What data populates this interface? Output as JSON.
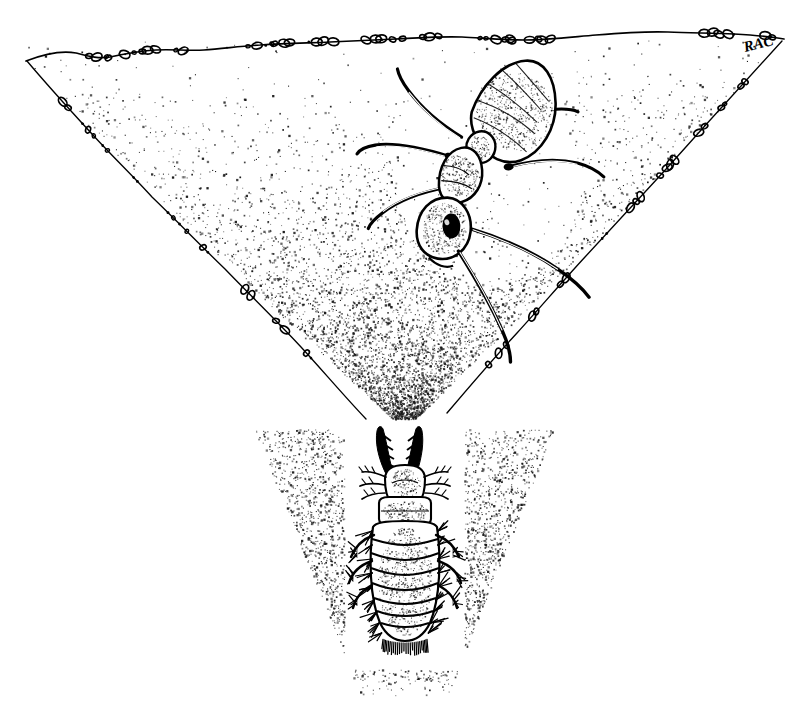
{
  "illustration": {
    "title": "Antlion pit trap with ant prey",
    "medium": "pen-and-ink stipple drawing",
    "background_color": "#ffffff",
    "ink_color": "#000000",
    "width": 811,
    "height": 715
  },
  "signature": {
    "text": "RAC",
    "x": 745,
    "y": 50
  },
  "ground": {
    "label": "ground surface line",
    "path": "M 26,61 C 50,52 66,50 78,54 C 90,58 100,60 112,57 C 126,53 140,50 160,50 C 182,50 200,52 222,49 C 250,45 272,44 300,42 C 330,40 360,41 392,39 C 424,37 452,36 478,37 C 500,38 520,40 544,40 C 570,40 596,36 622,34 C 650,32 676,31 700,32 C 724,33 748,33 768,35 C 776,36 780,37 784,39",
    "pebble_label": "surface sand grain"
  },
  "pit": {
    "label": "conical sand pit",
    "left_wall_path": "M 27,61 C 48,86 70,110 92,134 C 112,156 132,176 152,196 C 176,220 200,244 224,268 C 250,294 276,320 300,346 C 322,370 344,396 364,418",
    "right_wall_path": "M 782,40 C 762,62 742,84 722,106 C 700,130 678,154 656,178 C 632,204 608,230 584,256 C 560,282 538,308 516,332 C 492,358 468,386 446,412",
    "apex": {
      "x": 405,
      "y": 430
    }
  },
  "ant": {
    "label": "ant sliding down pit wall",
    "common_name": "ant",
    "position": {
      "x": 490,
      "y": 180
    },
    "parts": [
      {
        "name": "gaster",
        "label": "gaster (abdomen)"
      },
      {
        "name": "petiole",
        "label": "petiole"
      },
      {
        "name": "mesosoma",
        "label": "mesosoma (thorax)"
      },
      {
        "name": "head",
        "label": "head"
      },
      {
        "name": "eye",
        "label": "compound eye"
      },
      {
        "name": "antenna",
        "label": "antenna"
      },
      {
        "name": "legs",
        "label": "legs"
      }
    ]
  },
  "antlion": {
    "label": "antlion larva (doodlebug) at pit bottom",
    "common_name": "antlion larva",
    "position": {
      "x": 405,
      "y": 545
    },
    "parts": [
      {
        "name": "mandible-left",
        "label": "left mandible"
      },
      {
        "name": "mandible-right",
        "label": "right mandible"
      },
      {
        "name": "head",
        "label": "head capsule"
      },
      {
        "name": "prothorax",
        "label": "prothorax"
      },
      {
        "name": "abdomen",
        "label": "segmented abdomen"
      },
      {
        "name": "legs",
        "label": "bristled legs"
      },
      {
        "name": "setae",
        "label": "setae (bristles)"
      }
    ]
  },
  "stipple": {
    "label": "sand texture stippling",
    "seed": 20240517,
    "regions": [
      {
        "name": "funnel-interior",
        "density": "medium"
      },
      {
        "name": "wall-shadow-left",
        "density": "high"
      },
      {
        "name": "wall-shadow-right",
        "density": "high"
      },
      {
        "name": "pit-throat",
        "density": "very-high"
      }
    ]
  }
}
